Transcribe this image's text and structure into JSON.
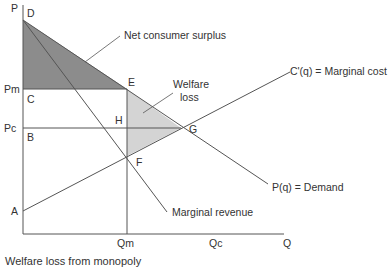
{
  "caption": "Welfare loss from monopoly",
  "diagram": {
    "axis_labels": {
      "y": "P",
      "x": "Q"
    },
    "points": {
      "D": "D",
      "E": "E",
      "C": "C",
      "H": "H",
      "B": "B",
      "G": "G",
      "F": "F",
      "A": "A"
    },
    "price_ticks": {
      "pm": "Pm",
      "pc": "Pc"
    },
    "quantity_ticks": {
      "qm": "Qm",
      "qc": "Qc"
    },
    "curve_labels": {
      "marginal_cost": "C'(q) = Marginal cost",
      "demand": "P(q) = Demand",
      "marginal_revenue": "Marginal revenue"
    },
    "area_labels": {
      "consumer_surplus": "Net consumer surplus",
      "welfare_loss_line1": "Welfare",
      "welfare_loss_line2": "loss"
    },
    "colors": {
      "consumer_surplus_fill": "#8c8c8c",
      "welfare_loss_fill": "#d4d4d4",
      "line": "#555555"
    }
  }
}
